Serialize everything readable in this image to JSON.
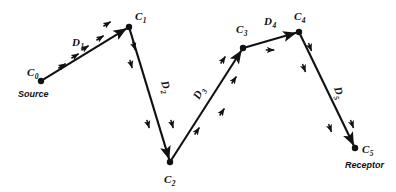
{
  "figure": {
    "type": "path-diagram",
    "background_color": "#ffffff",
    "ink_color": "#111111",
    "width": 396,
    "height": 192
  },
  "nodes": [
    {
      "id": "c0",
      "label": "C",
      "subscript": "0",
      "role_caption": "Source",
      "x": 41,
      "y": 81,
      "label_x": 27,
      "label_y": 76,
      "caption_x": 18,
      "caption_y": 97
    },
    {
      "id": "c1",
      "label": "C",
      "subscript": "1",
      "role_caption": "",
      "x": 129,
      "y": 27,
      "label_x": 135,
      "label_y": 20,
      "caption_x": 0,
      "caption_y": 0
    },
    {
      "id": "c2",
      "label": "C",
      "subscript": "2",
      "role_caption": "",
      "x": 170,
      "y": 162,
      "label_x": 164,
      "label_y": 183,
      "caption_x": 0,
      "caption_y": 0
    },
    {
      "id": "c3",
      "label": "C",
      "subscript": "3",
      "role_caption": "",
      "x": 243,
      "y": 48,
      "label_x": 236,
      "label_y": 33,
      "caption_x": 0,
      "caption_y": 0
    },
    {
      "id": "c4",
      "label": "C",
      "subscript": "4",
      "role_caption": "",
      "x": 299,
      "y": 32,
      "label_x": 294,
      "label_y": 20,
      "caption_x": 0,
      "caption_y": 0
    },
    {
      "id": "c5",
      "label": "C",
      "subscript": "5",
      "role_caption": "Receptor",
      "x": 355,
      "y": 148,
      "label_x": 362,
      "label_y": 153,
      "caption_x": 345,
      "caption_y": 168
    }
  ],
  "segments": [
    {
      "id": "d1",
      "label": "D",
      "subscript": "1",
      "from": "c0",
      "to": "c1",
      "label_x": 72,
      "label_y": 46,
      "label_rotation": 0
    },
    {
      "id": "d2",
      "label": "D",
      "subscript": "2",
      "from": "c1",
      "to": "c2",
      "label_x": 161,
      "label_y": 82,
      "label_rotation": 73
    },
    {
      "id": "d3",
      "label": "D",
      "subscript": "3",
      "from": "c2",
      "to": "c3",
      "label_x": 199,
      "label_y": 100,
      "label_rotation": -62
    },
    {
      "id": "d4",
      "label": "D",
      "subscript": "4",
      "from": "c3",
      "to": "c4",
      "label_x": 264,
      "label_y": 25,
      "label_rotation": 0
    },
    {
      "id": "d5",
      "label": "D",
      "subscript": "5",
      "from": "c4",
      "to": "c5",
      "label_x": 334,
      "label_y": 88,
      "label_rotation": 73
    }
  ],
  "flow_ticks": [
    {
      "x": 62,
      "y": 66,
      "angle": -32
    },
    {
      "x": 75,
      "y": 56,
      "angle": -32
    },
    {
      "x": 85,
      "y": 48,
      "angle": -32
    },
    {
      "x": 100,
      "y": 38,
      "angle": -32
    },
    {
      "x": 107,
      "y": 24,
      "angle": -32
    },
    {
      "x": 134,
      "y": 46,
      "angle": 74
    },
    {
      "x": 131,
      "y": 64,
      "angle": 74
    },
    {
      "x": 148,
      "y": 124,
      "angle": 74
    },
    {
      "x": 172,
      "y": 124,
      "angle": 74
    },
    {
      "x": 197,
      "y": 131,
      "angle": -56
    },
    {
      "x": 222,
      "y": 112,
      "angle": -56
    },
    {
      "x": 223,
      "y": 60,
      "angle": -56
    },
    {
      "x": 234,
      "y": 80,
      "angle": -56
    },
    {
      "x": 270,
      "y": 50,
      "angle": 0
    },
    {
      "x": 310,
      "y": 47,
      "angle": 70
    },
    {
      "x": 304,
      "y": 68,
      "angle": 70
    },
    {
      "x": 330,
      "y": 128,
      "angle": 70
    },
    {
      "x": 352,
      "y": 124,
      "angle": 70
    }
  ]
}
